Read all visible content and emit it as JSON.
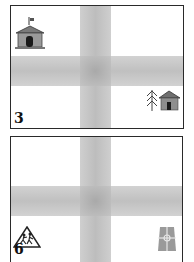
{
  "panels": [
    {
      "number": "3",
      "icons": [
        "town-hall-icon",
        "tree-and-cabin-icon"
      ]
    },
    {
      "number": "6",
      "icons": [
        "children-crossing-sign-icon",
        "road-junction-icon"
      ]
    }
  ],
  "colors": {
    "road": "#c4c4c4",
    "border": "#2a2a2a",
    "background": "#ffffff",
    "building": "#8a8a8a",
    "door": "#1a1a1a"
  }
}
